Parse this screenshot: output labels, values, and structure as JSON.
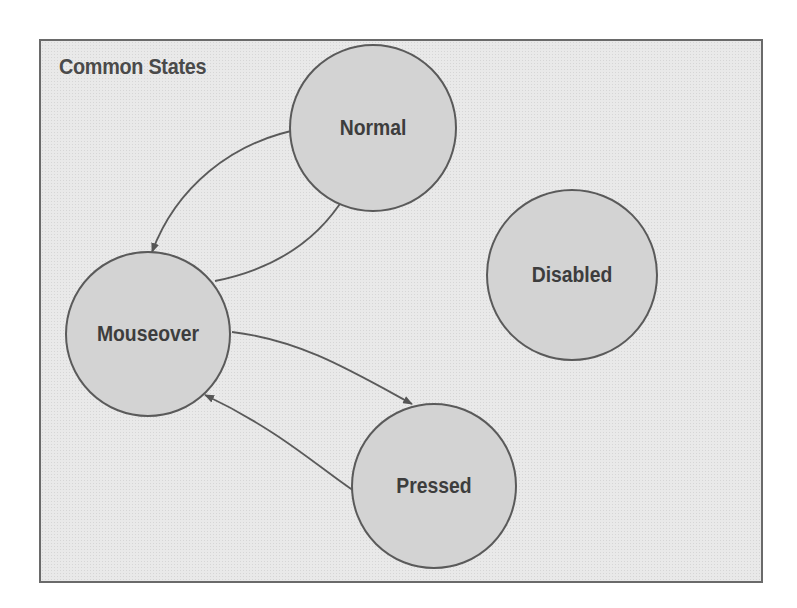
{
  "diagram": {
    "title": "Common States",
    "nodes": [
      {
        "id": "normal",
        "label": "Normal",
        "cx": 373,
        "cy": 128,
        "r": 83
      },
      {
        "id": "mouseover",
        "label": "Mouseover",
        "cx": 148,
        "cy": 334,
        "r": 82
      },
      {
        "id": "disabled",
        "label": "Disabled",
        "cx": 572,
        "cy": 275,
        "r": 85
      },
      {
        "id": "pressed",
        "label": "Pressed",
        "cx": 434,
        "cy": 486,
        "r": 82
      }
    ],
    "edges": [
      {
        "from": "normal",
        "to": "mouseover"
      },
      {
        "from": "mouseover",
        "to": "normal"
      },
      {
        "from": "mouseover",
        "to": "pressed"
      },
      {
        "from": "pressed",
        "to": "mouseover"
      }
    ],
    "colors": {
      "node_fill": "#d3d3d3",
      "node_stroke": "#5a5a5a",
      "frame_bg": "#e9e9e9",
      "text": "#3d3d3d"
    }
  }
}
